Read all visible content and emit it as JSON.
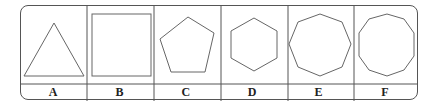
{
  "diagram": {
    "cells": [
      {
        "label": "A",
        "shape": "triangle",
        "sides": 3
      },
      {
        "label": "B",
        "shape": "square",
        "sides": 4
      },
      {
        "label": "C",
        "shape": "pentagon",
        "sides": 5
      },
      {
        "label": "D",
        "shape": "hexagon",
        "sides": 6
      },
      {
        "label": "E",
        "shape": "octagon",
        "sides": 8
      },
      {
        "label": "F",
        "shape": "decagon",
        "sides": 10
      }
    ],
    "stroke_color": "#555555"
  }
}
